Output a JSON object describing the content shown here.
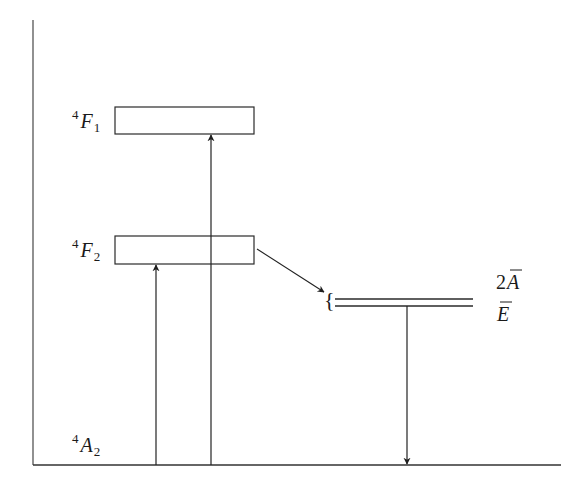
{
  "diagram": {
    "type": "energy-level-diagram",
    "colors": {
      "line": "#2a2a2a",
      "text": "#1a1a1a",
      "background": "#ffffff"
    },
    "levels": [
      {
        "id": "4F1",
        "superscript": "4",
        "symbol": "F",
        "subscript": "1",
        "shape": "band-box"
      },
      {
        "id": "4F2",
        "superscript": "4",
        "symbol": "F",
        "subscript": "2",
        "shape": "band-box"
      },
      {
        "id": "2A",
        "prefix": "2",
        "symbol": "A",
        "overbar": true,
        "shape": "sharp-line"
      },
      {
        "id": "E",
        "prefix": "",
        "symbol": "E",
        "overbar": true,
        "shape": "sharp-line"
      },
      {
        "id": "4A2",
        "superscript": "4",
        "symbol": "A",
        "subscript": "2",
        "shape": "ground-line"
      }
    ],
    "transitions": [
      {
        "from": "4A2",
        "to": "4F2",
        "kind": "absorption"
      },
      {
        "from": "4A2",
        "to": "4F1",
        "kind": "absorption"
      },
      {
        "from": "4F2",
        "to": "2A/E",
        "kind": "non-radiative decay"
      },
      {
        "from": "E",
        "to": "4A2",
        "kind": "emission"
      }
    ],
    "brace": "{"
  }
}
